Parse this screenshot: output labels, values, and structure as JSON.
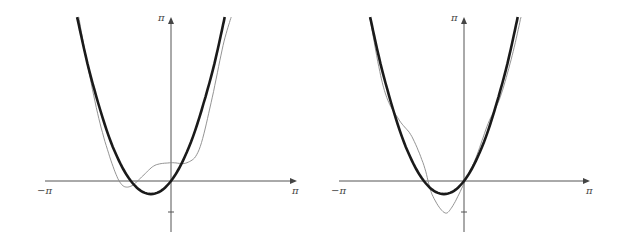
{
  "chart_data": [
    {
      "type": "line",
      "title": "",
      "xlabel": "",
      "ylabel": "",
      "xlim": [
        -3.1416,
        3.1416
      ],
      "ylim": [
        -1.2,
        3.1416
      ],
      "x_tick_labels": [
        "−π",
        "π"
      ],
      "y_tick_labels": [
        "π"
      ],
      "grid": false,
      "legend": null,
      "series": [
        {
          "name": "f(x) = x² + x",
          "style": "thick",
          "color": "#1a1a1a",
          "x": [
            -2.34,
            -2.0,
            -1.5,
            -1.0,
            -0.5,
            0.0,
            0.5,
            1.0,
            1.34
          ],
          "values": [
            3.14,
            2.0,
            0.75,
            0.0,
            -0.25,
            0.0,
            0.75,
            2.0,
            3.14
          ]
        },
        {
          "name": "partial sum (low order)",
          "style": "thin",
          "color": "#777777",
          "x": [
            -2.3,
            -2.1,
            -1.8,
            -1.5,
            -1.25,
            -1.0,
            -0.7,
            -0.4,
            0.0,
            0.4,
            0.7,
            1.0,
            1.3,
            1.5
          ],
          "values": [
            3.14,
            2.3,
            1.2,
            0.4,
            -0.05,
            -0.1,
            0.1,
            0.3,
            0.35,
            0.35,
            0.6,
            1.5,
            2.6,
            3.14
          ]
        }
      ]
    },
    {
      "type": "line",
      "title": "",
      "xlabel": "",
      "ylabel": "",
      "xlim": [
        -3.1416,
        3.1416
      ],
      "ylim": [
        -1.2,
        3.1416
      ],
      "x_tick_labels": [
        "−π",
        "π"
      ],
      "y_tick_labels": [
        "π"
      ],
      "grid": false,
      "legend": null,
      "series": [
        {
          "name": "f(x) = x² + x",
          "style": "thick",
          "color": "#1a1a1a",
          "x": [
            -2.34,
            -2.0,
            -1.5,
            -1.0,
            -0.5,
            0.0,
            0.5,
            1.0,
            1.34
          ],
          "values": [
            3.14,
            2.0,
            0.75,
            0.0,
            -0.25,
            0.0,
            0.75,
            2.0,
            3.14
          ]
        },
        {
          "name": "partial sum (higher order)",
          "style": "thin",
          "color": "#777777",
          "x": [
            -2.35,
            -2.1,
            -1.9,
            -1.6,
            -1.3,
            -1.0,
            -0.8,
            -0.5,
            -0.3,
            0.0,
            0.3,
            0.6,
            0.9,
            1.2,
            1.42
          ],
          "values": [
            3.14,
            2.1,
            1.55,
            1.15,
            0.85,
            0.3,
            -0.25,
            -0.6,
            -0.5,
            -0.05,
            0.45,
            1.1,
            1.6,
            2.4,
            3.14
          ]
        }
      ]
    }
  ],
  "panels": [
    {
      "x_min_label": "−π",
      "x_max_label": "π",
      "y_max_label": "π"
    },
    {
      "x_min_label": "−π",
      "x_max_label": "π",
      "y_max_label": "π"
    }
  ],
  "colors": {
    "axis": "#555555",
    "thick": "#1a1a1a",
    "thin": "#777777"
  }
}
